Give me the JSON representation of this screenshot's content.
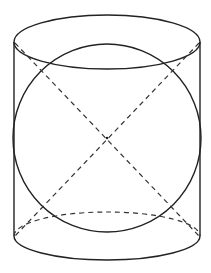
{
  "diagram": {
    "title": "",
    "colors": {
      "stroke": "#222222",
      "background": "#ffffff"
    },
    "cylinder": {
      "left_x": 14,
      "right_x": 200,
      "top_cy": 42,
      "top_ry": 27,
      "bottom_cy": 236,
      "bottom_ry": 24
    },
    "sphere": {
      "cx": 107,
      "cy": 138,
      "r": 94
    },
    "center_point": {
      "x": 107,
      "y": 138
    },
    "dashed_lines": [
      {
        "from": [
          15,
          43
        ],
        "to": [
          199,
          236
        ]
      },
      {
        "from": [
          199,
          43
        ],
        "to": [
          15,
          236
        ]
      }
    ]
  }
}
